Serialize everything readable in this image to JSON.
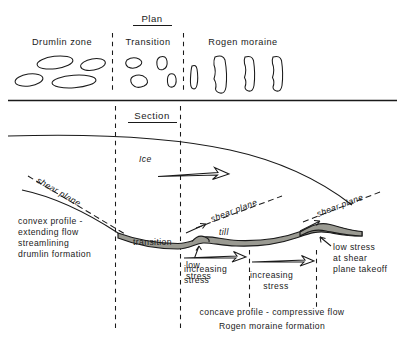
{
  "figure": {
    "background_color": "#ffffff",
    "ink_color": "#1a1a1a",
    "till_fill_color": "#9a9a92"
  },
  "plan": {
    "title": "Plan",
    "zones": [
      {
        "id": "drumlin-zone",
        "label": "Drumlin  zone"
      },
      {
        "id": "transition",
        "label": "Transition"
      },
      {
        "id": "rogen-moraine",
        "label": "Rogen  moraine"
      }
    ]
  },
  "section": {
    "title": "Section",
    "ice_label": "Ice",
    "till_label": "till",
    "transition_label": "transition",
    "shear_plane_labels": [
      "shear  plane",
      "shear  plane",
      "shear  plane"
    ],
    "stress_labels": [
      {
        "id": "increasing-stress-1",
        "lines": [
          "increasing",
          "stress"
        ]
      },
      {
        "id": "low-stress-1",
        "lines": [
          "low",
          "stress"
        ]
      },
      {
        "id": "increasing-stress-2",
        "lines": [
          "increasing",
          "stress"
        ]
      },
      {
        "id": "low-stress-takeoff",
        "lines": [
          "low  stress",
          "at  shear",
          "plane  takeoff"
        ]
      }
    ],
    "left_caption": [
      "convex  profile -",
      "extending  flow",
      "streamlining",
      "drumlin  formation"
    ],
    "bottom_caption": [
      "concave  profile - compressive  flow",
      "Rogen  moraine  formation"
    ]
  }
}
